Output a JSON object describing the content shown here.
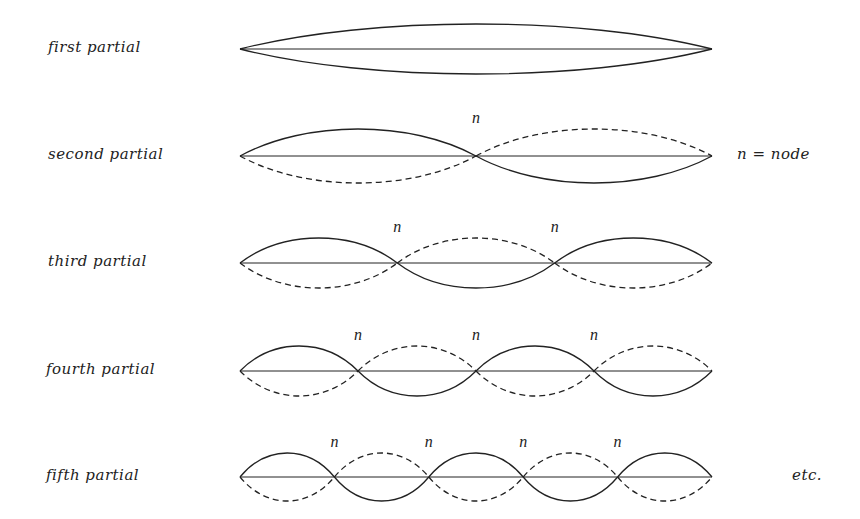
{
  "diagram": {
    "string": {
      "x_start": 240,
      "x_end": 712
    },
    "rows": [
      {
        "label": "first partial",
        "y": 49,
        "segments": 1,
        "amplitude": 25,
        "node_labels": []
      },
      {
        "label": "second partial",
        "y": 156,
        "segments": 2,
        "amplitude": 27,
        "node_labels": [
          "n"
        ]
      },
      {
        "label": "third partial",
        "y": 263,
        "segments": 3,
        "amplitude": 25,
        "node_labels": [
          "n",
          "n"
        ]
      },
      {
        "label": "fourth partial",
        "y": 371,
        "segments": 4,
        "amplitude": 25,
        "node_labels": [
          "n",
          "n",
          "n"
        ]
      },
      {
        "label": "fifth partial",
        "y": 477,
        "segments": 5,
        "amplitude": 24,
        "node_labels": [
          "n",
          "n",
          "n",
          "n"
        ]
      }
    ],
    "legend": {
      "text": "n = node",
      "y": 156
    },
    "footer_note": {
      "text": "etc.",
      "y": 477
    },
    "colors": {
      "ink": "#222222",
      "background": "#ffffff"
    }
  }
}
